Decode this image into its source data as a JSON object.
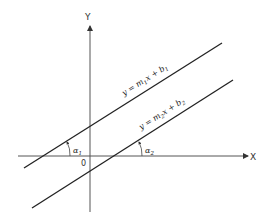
{
  "diagram": {
    "type": "coordinate-plane-parallel-lines",
    "axes": {
      "x_label": "X",
      "y_label": "Y",
      "origin_label": "0"
    },
    "lines": [
      {
        "name": "line-1",
        "equation": "y = m₁x + b₁",
        "equation_parts": {
          "prefix": "y = m",
          "sub1": "1",
          "mid": "x + b",
          "sub2": "1"
        },
        "angle_label": "α",
        "angle_sub": "1"
      },
      {
        "name": "line-2",
        "equation": "y = m₂x + b₂",
        "equation_parts": {
          "prefix": "y = m",
          "sub1": "2",
          "mid": "x + b",
          "sub2": "2"
        },
        "angle_label": "α",
        "angle_sub": "2"
      }
    ],
    "colors": {
      "line": "#222222",
      "axis": "#555555",
      "background": "#ffffff"
    }
  }
}
